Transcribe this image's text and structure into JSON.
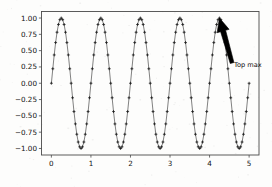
{
  "figure": {
    "background_color": "#fdfdfc",
    "axes_color": "#4a4a4a",
    "curve_color": "#1a1a1a",
    "annotation_color": "#000000"
  },
  "annotation": {
    "label": "Top max",
    "target_x": 4.25,
    "target_y": 1.0,
    "text_x": 4.62,
    "text_y": 0.28
  },
  "chart_data": {
    "type": "line",
    "title": "",
    "xlabel": "",
    "ylabel": "",
    "xlim": [
      -0.25,
      5.25
    ],
    "ylim": [
      -1.1,
      1.1
    ],
    "grid": false,
    "legend": null,
    "marker": "plus",
    "linestyle": "solid",
    "series": [
      {
        "name": "sin(2πx)",
        "formula": "y = sin(2*pi*x)",
        "x_start": 0,
        "x_end": 5,
        "n_points": 141,
        "amplitude": 1.0,
        "period": 1.0,
        "peaks_x": [
          0.25,
          1.25,
          2.25,
          3.25,
          4.25
        ],
        "peaks_y": [
          1.0,
          1.0,
          1.0,
          1.0,
          1.0
        ],
        "troughs_x": [
          0.75,
          1.75,
          2.75,
          3.75,
          4.75
        ],
        "troughs_y": [
          -1.0,
          -1.0,
          -1.0,
          -1.0,
          -1.0
        ]
      }
    ],
    "xticks": [
      0,
      1,
      2,
      3,
      4,
      5
    ],
    "xticklabels": [
      "0",
      "1",
      "2",
      "3",
      "4",
      "5"
    ],
    "yticks": [
      1.0,
      0.75,
      0.5,
      0.25,
      0.0,
      -0.25,
      -0.5,
      -0.75,
      -1.0
    ],
    "yticklabels": [
      "1.00",
      "0.75",
      "0.50",
      "0.25",
      "0.00",
      "−0.25",
      "−0.50",
      "−0.75",
      "−1.00"
    ]
  }
}
